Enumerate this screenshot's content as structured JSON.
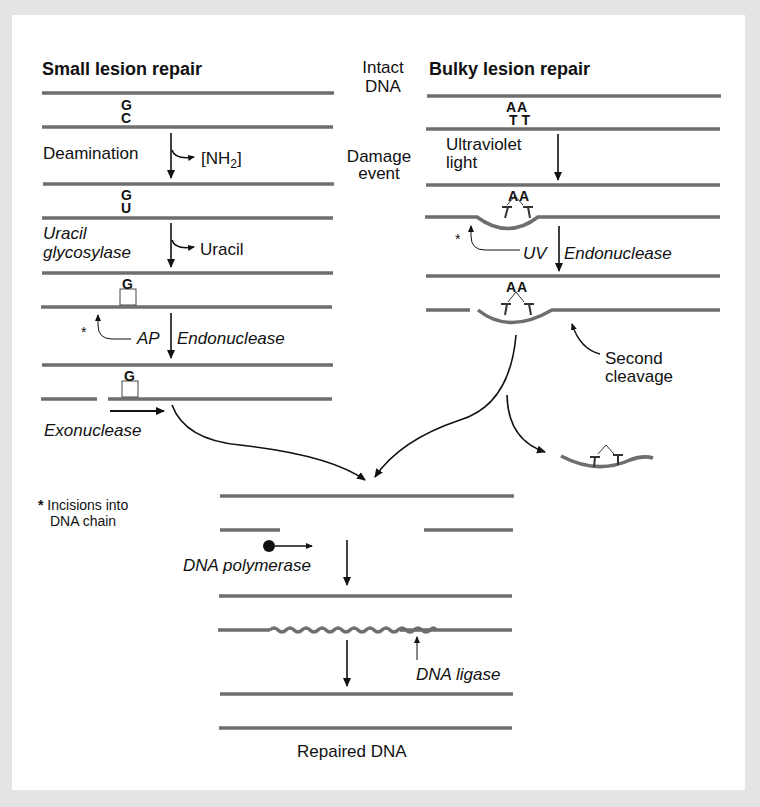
{
  "titles": {
    "small": "Small lesion repair",
    "bulky": "Bulky lesion repair"
  },
  "center_labels": {
    "intact_1": "Intact",
    "intact_2": "DNA",
    "damage_1": "Damage",
    "damage_2": "event"
  },
  "small": {
    "base_top_1": "G",
    "base_bot_1": "C",
    "step1": "Deamination",
    "product1": "[NH",
    "product1_sub": "2",
    "product1_end": "]",
    "base_top_2": "G",
    "base_bot_2": "U",
    "step2_line1": "Uracil",
    "step2_line2": "glycosylase",
    "product2": "Uracil",
    "base_top_3": "G",
    "step3_a": "AP",
    "step3_b": "Endonuclease",
    "star": "*",
    "base_top_4": "G",
    "step4": "Exonuclease"
  },
  "bulky": {
    "bases_top_1": "AA",
    "bases_bot_1": "TT",
    "step1_line1": "Ultraviolet",
    "step1_line2": "light",
    "bases_top_2": "AA",
    "step2_a": "UV",
    "step2_b": "Endonuclease",
    "star": "*",
    "bases_top_3": "AA",
    "second_1": "Second",
    "second_2": "cleavage"
  },
  "footnote": {
    "star": "*",
    "line1": "Incisions into",
    "line2": "DNA chain"
  },
  "bottom": {
    "polymerase": "DNA polymerase",
    "ligase": "DNA ligase",
    "result": "Repaired DNA"
  },
  "colors": {
    "strand": "#6e6e6e",
    "arrow": "#111111",
    "background": "#e4e4e4",
    "panel": "#ffffff"
  }
}
